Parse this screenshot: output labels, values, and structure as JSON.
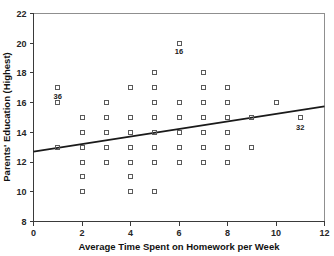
{
  "chart_data": {
    "type": "scatter",
    "title": "",
    "xlabel": "Average Time Spent on Homework per Week",
    "ylabel": "Parents' Education (Highest)",
    "xlim": [
      0,
      12
    ],
    "ylim": [
      8,
      22
    ],
    "xticks": [
      0,
      2,
      4,
      6,
      8,
      10,
      12
    ],
    "yticks": [
      8,
      10,
      12,
      14,
      16,
      18,
      20,
      22
    ],
    "xtick_labels": [
      "0",
      "2",
      "4",
      "6",
      "8",
      "10",
      "12"
    ],
    "ytick_labels": [
      "8",
      "10",
      "12",
      "14",
      "16",
      "18",
      "20",
      "22"
    ],
    "grid": false,
    "legend": false,
    "marker": "open-square",
    "marker_color": "#5a5a5a",
    "points": [
      {
        "x": 1,
        "y": 17
      },
      {
        "x": 1,
        "y": 16
      },
      {
        "x": 1,
        "y": 13
      },
      {
        "x": 2,
        "y": 15
      },
      {
        "x": 2,
        "y": 14
      },
      {
        "x": 2,
        "y": 13
      },
      {
        "x": 2,
        "y": 12
      },
      {
        "x": 2,
        "y": 11
      },
      {
        "x": 2,
        "y": 10
      },
      {
        "x": 3,
        "y": 16
      },
      {
        "x": 3,
        "y": 15
      },
      {
        "x": 3,
        "y": 14
      },
      {
        "x": 3,
        "y": 13
      },
      {
        "x": 3,
        "y": 12
      },
      {
        "x": 4,
        "y": 17
      },
      {
        "x": 4,
        "y": 15
      },
      {
        "x": 4,
        "y": 14
      },
      {
        "x": 4,
        "y": 13
      },
      {
        "x": 4,
        "y": 12
      },
      {
        "x": 4,
        "y": 11
      },
      {
        "x": 4,
        "y": 10
      },
      {
        "x": 5,
        "y": 18
      },
      {
        "x": 5,
        "y": 17
      },
      {
        "x": 5,
        "y": 16
      },
      {
        "x": 5,
        "y": 15
      },
      {
        "x": 5,
        "y": 14
      },
      {
        "x": 5,
        "y": 13
      },
      {
        "x": 5,
        "y": 12
      },
      {
        "x": 5,
        "y": 10
      },
      {
        "x": 6,
        "y": 20
      },
      {
        "x": 6,
        "y": 16
      },
      {
        "x": 6,
        "y": 15
      },
      {
        "x": 6,
        "y": 14
      },
      {
        "x": 6,
        "y": 13
      },
      {
        "x": 6,
        "y": 12
      },
      {
        "x": 7,
        "y": 18
      },
      {
        "x": 7,
        "y": 17
      },
      {
        "x": 7,
        "y": 16
      },
      {
        "x": 7,
        "y": 15
      },
      {
        "x": 7,
        "y": 14
      },
      {
        "x": 7,
        "y": 13
      },
      {
        "x": 7,
        "y": 12
      },
      {
        "x": 8,
        "y": 17
      },
      {
        "x": 8,
        "y": 16
      },
      {
        "x": 8,
        "y": 15
      },
      {
        "x": 8,
        "y": 14
      },
      {
        "x": 8,
        "y": 13
      },
      {
        "x": 8,
        "y": 12
      },
      {
        "x": 9,
        "y": 15
      },
      {
        "x": 9,
        "y": 13
      },
      {
        "x": 10,
        "y": 16
      },
      {
        "x": 11,
        "y": 15
      }
    ],
    "point_labels": [
      {
        "text": "36",
        "x": 1,
        "y": 17,
        "dx": 0,
        "dy": -0.75
      },
      {
        "text": "16",
        "x": 6,
        "y": 20,
        "dx": 0,
        "dy": -0.75
      },
      {
        "text": "32",
        "x": 11,
        "y": 15,
        "dx": 0,
        "dy": -0.85
      }
    ],
    "fit_line": {
      "x_start": 0,
      "y_start": 12.7,
      "x_end": 12,
      "y_end": 15.75,
      "color": "#1a1a1a"
    }
  }
}
